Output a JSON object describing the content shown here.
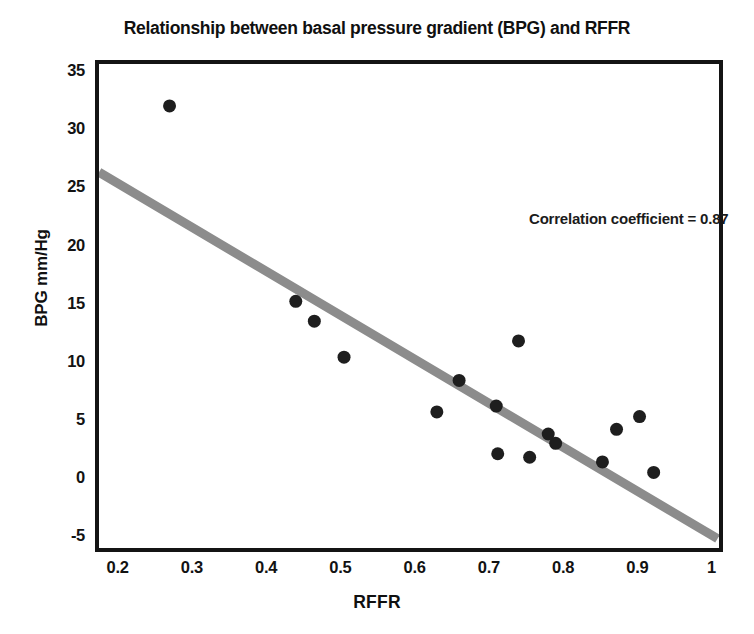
{
  "chart_data": {
    "type": "scatter",
    "title": "Relationship between basal pressure gradient (BPG) and RFFR",
    "xlabel": "RFFR",
    "ylabel": "BPG mm/Hg",
    "xlim": [
      0.175,
      1.01
    ],
    "ylim": [
      -6.0,
      35.6
    ],
    "xticks": [
      0.2,
      0.3,
      0.4,
      0.5,
      0.6,
      0.7,
      0.8,
      0.9,
      1
    ],
    "xtick_labels": [
      "0.2",
      "0.3",
      "0.4",
      "0.5",
      "0.6",
      "0.7",
      "0.8",
      "0.9",
      "1"
    ],
    "yticks": [
      -5,
      0,
      5,
      10,
      15,
      20,
      25,
      30,
      35
    ],
    "ytick_labels": [
      "-5",
      "0",
      "5",
      "10",
      "15",
      "20",
      "25",
      "30",
      "35"
    ],
    "grid": false,
    "legend": null,
    "annotations": [
      {
        "text": "Correlation coefficient = 0.87",
        "x": 0.63,
        "y": 23.3
      }
    ],
    "marker_color": "#1e1e1e",
    "marker_size": 13,
    "series": [
      {
        "name": "BPG vs RFFR",
        "points": [
          {
            "x": 0.27,
            "y": 32.0
          },
          {
            "x": 0.44,
            "y": 15.2
          },
          {
            "x": 0.465,
            "y": 13.5
          },
          {
            "x": 0.505,
            "y": 10.4
          },
          {
            "x": 0.63,
            "y": 5.7
          },
          {
            "x": 0.66,
            "y": 8.4
          },
          {
            "x": 0.71,
            "y": 6.2
          },
          {
            "x": 0.712,
            "y": 2.1
          },
          {
            "x": 0.74,
            "y": 11.8
          },
          {
            "x": 0.755,
            "y": 1.8
          },
          {
            "x": 0.78,
            "y": 3.8
          },
          {
            "x": 0.79,
            "y": 3.0
          },
          {
            "x": 0.853,
            "y": 1.4
          },
          {
            "x": 0.872,
            "y": 4.2
          },
          {
            "x": 0.903,
            "y": 5.3
          },
          {
            "x": 0.922,
            "y": 0.5
          }
        ]
      }
    ],
    "trendline": {
      "name": "regression-line",
      "color": "#8c8c8c",
      "width": 9,
      "x0": 0.175,
      "y0": 26.3,
      "x1": 1.008,
      "y1": -5.2
    }
  },
  "axis": {
    "frame_color": "#141414"
  }
}
